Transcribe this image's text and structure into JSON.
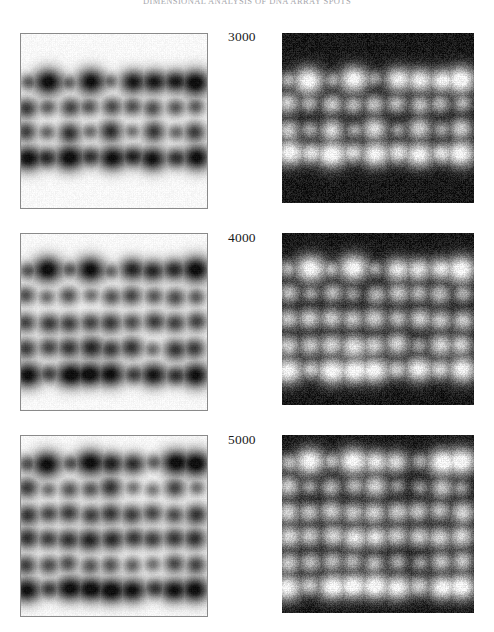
{
  "header": {
    "running_title": "DIMENSIONAL ANALYSIS OF DNA ARRAY SPOTS"
  },
  "figure": {
    "background_color": "#ffffff",
    "panel_border_color": "#8a8a8a",
    "negative_background_color": "#16161a",
    "rows": [
      {
        "label": "3000",
        "positive_panel_name": "positive-blot-3000",
        "negative_panel_name": "negative-blot-3000"
      },
      {
        "label": "4000",
        "positive_panel_name": "positive-blot-4000",
        "negative_panel_name": "negative-blot-4000"
      },
      {
        "label": "5000",
        "positive_panel_name": "positive-blot-5000",
        "negative_panel_name": "negative-blot-5000"
      }
    ]
  },
  "chart_data": {
    "type": "heatmap",
    "title": "DIMENSIONAL ANALYSIS OF DNA ARRAY SPOTS",
    "xlabel": "",
    "ylabel": "",
    "legend_position": "none",
    "grid": false,
    "row_labels": [
      "3000",
      "4000",
      "5000"
    ],
    "column_labels": [
      "positive image",
      "negative image"
    ],
    "panels": [
      {
        "label": "3000",
        "polarity": "positive",
        "spot_rows": 4,
        "spot_columns": 9,
        "grid_pitch_px": 20,
        "intensity": [
          [
            0.35,
            0.95,
            0.3,
            0.92,
            0.28,
            0.8,
            0.78,
            0.72,
            0.96
          ],
          [
            0.62,
            0.4,
            0.55,
            0.45,
            0.52,
            0.48,
            0.5,
            0.44,
            0.42
          ],
          [
            0.58,
            0.34,
            0.66,
            0.3,
            0.7,
            0.26,
            0.64,
            0.32,
            0.6
          ],
          [
            0.9,
            0.62,
            0.94,
            0.58,
            0.88,
            0.66,
            0.86,
            0.6,
            0.92
          ]
        ]
      },
      {
        "label": "3000",
        "polarity": "negative",
        "spot_rows": 4,
        "spot_columns": 9,
        "grid_pitch_px": 20,
        "note": "photographic inverse of the positive 3000 panel"
      },
      {
        "label": "4000",
        "polarity": "positive",
        "spot_rows": 5,
        "spot_columns": 9,
        "grid_pitch_px": 19,
        "intensity": [
          [
            0.4,
            0.95,
            0.35,
            0.93,
            0.3,
            0.74,
            0.7,
            0.66,
            0.96
          ],
          [
            0.5,
            0.32,
            0.48,
            0.3,
            0.46,
            0.55,
            0.44,
            0.52,
            0.42
          ],
          [
            0.56,
            0.6,
            0.58,
            0.54,
            0.62,
            0.5,
            0.6,
            0.56,
            0.58
          ],
          [
            0.6,
            0.54,
            0.62,
            0.72,
            0.58,
            0.66,
            0.3,
            0.64,
            0.6
          ],
          [
            0.92,
            0.48,
            0.9,
            0.86,
            0.88,
            0.52,
            0.84,
            0.58,
            0.9
          ]
        ]
      },
      {
        "label": "4000",
        "polarity": "negative",
        "spot_rows": 5,
        "spot_columns": 9,
        "grid_pitch_px": 19,
        "note": "photographic inverse of the positive 4000 panel"
      },
      {
        "label": "5000",
        "polarity": "positive",
        "spot_rows": 6,
        "spot_columns": 9,
        "grid_pitch_px": 18,
        "intensity": [
          [
            0.42,
            0.94,
            0.38,
            0.92,
            0.72,
            0.68,
            0.34,
            0.9,
            0.95
          ],
          [
            0.62,
            0.3,
            0.46,
            0.44,
            0.66,
            0.28,
            0.26,
            0.56,
            0.3
          ],
          [
            0.64,
            0.52,
            0.6,
            0.56,
            0.62,
            0.58,
            0.54,
            0.5,
            0.66
          ],
          [
            0.68,
            0.56,
            0.64,
            0.74,
            0.7,
            0.6,
            0.58,
            0.62,
            0.68
          ],
          [
            0.58,
            0.5,
            0.48,
            0.44,
            0.46,
            0.38,
            0.3,
            0.52,
            0.54
          ],
          [
            0.9,
            0.52,
            0.88,
            0.86,
            0.9,
            0.84,
            0.56,
            0.82,
            0.92
          ]
        ]
      },
      {
        "label": "5000",
        "polarity": "negative",
        "spot_rows": 6,
        "spot_columns": 9,
        "grid_pitch_px": 18,
        "note": "photographic inverse of the positive 5000 panel"
      }
    ]
  }
}
